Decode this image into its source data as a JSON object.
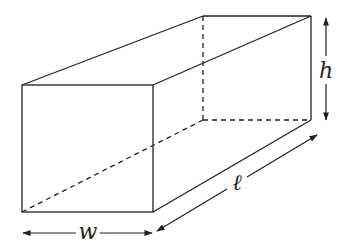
{
  "figure": {
    "type": "rectangular-prism",
    "colors": {
      "line": "#222222",
      "background": "#ffffff"
    }
  },
  "labels": {
    "width": "w",
    "height": "h",
    "length": "ℓ"
  }
}
